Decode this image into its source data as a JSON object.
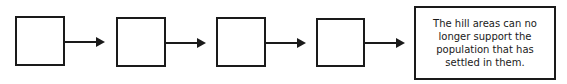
{
  "diagram": {
    "type": "flow-chain",
    "empty_boxes": 4,
    "final_box": {
      "text": "The hill areas can no longer support the population that has settled in them."
    }
  }
}
